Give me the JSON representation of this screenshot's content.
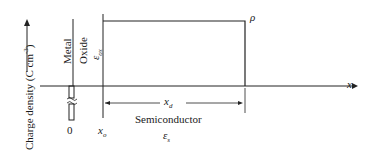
{
  "diagram": {
    "y_axis_label": "Charge density (C cm",
    "y_axis_label_sup": "-3",
    "y_axis_label_end": ")",
    "x_axis_label": "x",
    "rho_label": "ρ",
    "metal_label": "Metal",
    "oxide_label": "Oxide",
    "oxide_eps": "ε",
    "oxide_eps_sub": "ox",
    "zero_label": "0",
    "xo_label": "x",
    "xo_sub": "o",
    "xd_label": "x",
    "xd_sub": "d",
    "semiconductor_label": "Semiconductor",
    "semi_eps": "ε",
    "semi_eps_sub": "s"
  }
}
